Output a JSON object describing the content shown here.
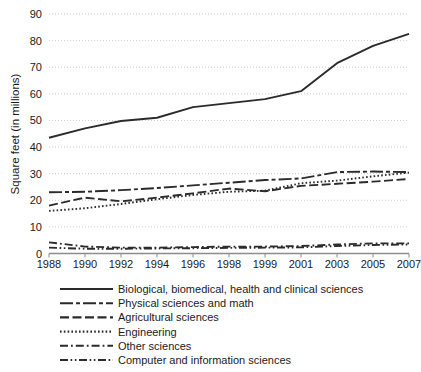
{
  "chart_data": {
    "type": "line",
    "title": "",
    "xlabel": "",
    "ylabel": "Square feet (in millions)",
    "categories": [
      "1988",
      "1990",
      "1992",
      "1994",
      "1996",
      "1998",
      "1999",
      "2001",
      "2003",
      "2005",
      "2007"
    ],
    "ylim": [
      0,
      90
    ],
    "yticks": [
      0,
      10,
      20,
      30,
      40,
      50,
      60,
      70,
      80,
      90
    ],
    "grid": true,
    "legend_position": "bottom",
    "series": [
      {
        "name": "Biological, biomedical, health and clinical sciences",
        "linestyle": "solid",
        "values": [
          43.5,
          47.0,
          49.8,
          51.0,
          55.0,
          56.5,
          58.0,
          61.0,
          71.5,
          78.0,
          82.5
        ]
      },
      {
        "name": "Physical sciences and math",
        "linestyle": "long-dash-dash",
        "values": [
          23.0,
          23.2,
          23.8,
          24.6,
          25.6,
          26.6,
          27.6,
          28.2,
          30.6,
          30.8,
          30.6
        ]
      },
      {
        "name": "Agricultural sciences",
        "linestyle": "dashed",
        "values": [
          18.0,
          21.0,
          19.6,
          21.0,
          22.6,
          24.4,
          23.4,
          25.4,
          26.2,
          27.0,
          28.0
        ]
      },
      {
        "name": "Engineering",
        "linestyle": "dotted",
        "values": [
          16.0,
          17.0,
          18.6,
          20.4,
          22.0,
          23.2,
          23.6,
          26.4,
          27.4,
          29.0,
          30.4
        ]
      },
      {
        "name": "Other sciences",
        "linestyle": "dash-dot",
        "values": [
          4.2,
          2.6,
          2.2,
          2.2,
          2.4,
          2.6,
          2.6,
          2.8,
          3.4,
          3.8,
          3.8
        ]
      },
      {
        "name": "Computer and information sciences",
        "linestyle": "dash-dot-dot",
        "values": [
          2.2,
          1.8,
          1.8,
          1.9,
          2.0,
          2.1,
          2.2,
          2.3,
          2.8,
          3.2,
          3.4
        ]
      }
    ]
  },
  "axes": {
    "y_title": "Square feet (in millions)",
    "y_tick_labels": [
      "90",
      "80",
      "70",
      "60",
      "50",
      "40",
      "30",
      "20",
      "10",
      "0"
    ],
    "x_tick_labels": [
      "1988",
      "1990",
      "1992",
      "1994",
      "1996",
      "1998",
      "1999",
      "2001",
      "2003",
      "2005",
      "2007"
    ]
  },
  "legend": {
    "items": [
      {
        "label": "Biological, biomedical, health and clinical sciences",
        "style": "solid"
      },
      {
        "label": "Physical sciences and math",
        "style": "long-dash-dash"
      },
      {
        "label": "Agricultural sciences",
        "style": "dashed"
      },
      {
        "label": "Engineering",
        "style": "dotted"
      },
      {
        "label": "Other sciences",
        "style": "dash-dot"
      },
      {
        "label": "Computer and information sciences",
        "style": "dash-dot-dot"
      }
    ]
  },
  "colors": {
    "line": "#2b2b2b",
    "grid": "#bfbfbf",
    "axis": "#8c8c8c",
    "text": "#1a1a1a",
    "background": "#ffffff"
  }
}
